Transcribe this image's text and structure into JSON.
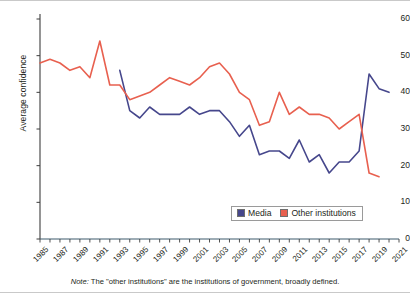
{
  "chart_data": {
    "type": "line",
    "title": "",
    "xlabel": "",
    "ylabel": "Average confidence",
    "xlim": [
      1985,
      2021
    ],
    "ylim": [
      0,
      60
    ],
    "grid": false,
    "legend_position": "bottom-right",
    "note": "The \"other institutions\" are the institutions of government, broadly defined.",
    "note_prefix": "Note:",
    "y_ticks": [
      0,
      10,
      20,
      30,
      40,
      50,
      60
    ],
    "x_ticks": [
      1985,
      1987,
      1989,
      1991,
      1993,
      1995,
      1997,
      1999,
      2001,
      2003,
      2005,
      2007,
      2009,
      2011,
      2013,
      2015,
      2017,
      2019,
      2021
    ],
    "x_minor_years": [
      1985,
      1986,
      1987,
      1988,
      1989,
      1990,
      1991,
      1992,
      1993,
      1994,
      1995,
      1996,
      1997,
      1998,
      1999,
      2000,
      2001,
      2002,
      2003,
      2004,
      2005,
      2006,
      2007,
      2008,
      2009,
      2010,
      2011,
      2012,
      2013,
      2014,
      2015,
      2016,
      2017,
      2018,
      2019,
      2020,
      2021
    ],
    "series": [
      {
        "name": "Media",
        "color": "#46478c",
        "x": [
          1993,
          1994,
          1995,
          1996,
          1997,
          1998,
          1999,
          2000,
          2001,
          2002,
          2003,
          2004,
          2005,
          2006,
          2007,
          2008,
          2009,
          2010,
          2011,
          2012,
          2013,
          2014,
          2015,
          2016,
          2017,
          2018,
          2019,
          2020
        ],
        "values": [
          46,
          35,
          33,
          36,
          34,
          34,
          34,
          36,
          34,
          35,
          35,
          32,
          28,
          31,
          23,
          24,
          24,
          22,
          27,
          21,
          23,
          18,
          21,
          21,
          24,
          45,
          41,
          40
        ]
      },
      {
        "name": "Other institutions",
        "color": "#e8604f",
        "x": [
          1985,
          1986,
          1987,
          1988,
          1989,
          1990,
          1991,
          1992,
          1993,
          1994,
          1995,
          1996,
          1997,
          1998,
          1999,
          2000,
          2001,
          2002,
          2003,
          2004,
          2005,
          2006,
          2007,
          2008,
          2009,
          2010,
          2011,
          2012,
          2013,
          2014,
          2015,
          2016,
          2017,
          2018,
          2019
        ],
        "values": [
          48,
          49,
          48,
          46,
          47,
          44,
          54,
          42,
          42,
          38,
          39,
          40,
          42,
          44,
          43,
          42,
          44,
          47,
          48,
          45,
          40,
          38,
          31,
          32,
          40,
          34,
          36,
          34,
          34,
          33,
          30,
          32,
          34,
          18,
          17
        ]
      }
    ]
  },
  "legend": {
    "items": [
      {
        "label": "Media",
        "color": "#46478c"
      },
      {
        "label": "Other institutions",
        "color": "#e8604f"
      }
    ]
  },
  "background_text": {
    "lines": [
      "",
      "",
      "",
      ""
    ]
  }
}
